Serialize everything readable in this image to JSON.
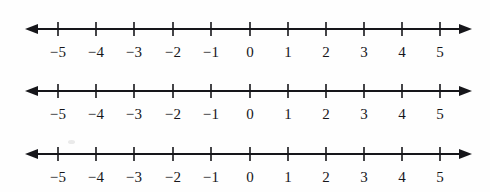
{
  "page": {
    "background_color": "#fefefe",
    "ink_color": "#16161a",
    "width": 490,
    "height": 192
  },
  "chart_data": {
    "type": "line",
    "xlabel": "",
    "ylabel": "",
    "grid": false,
    "legend": null,
    "xlim": [
      -5,
      5
    ],
    "axis_count": 3,
    "tick_values": [
      -5,
      -4,
      -3,
      -2,
      -1,
      0,
      1,
      2,
      3,
      4,
      5
    ],
    "tick_labels": [
      "−5",
      "−4",
      "−3",
      "−2",
      "−1",
      "0",
      "1",
      "2",
      "3",
      "4",
      "5"
    ],
    "tick_interval": 1,
    "arrow_ends": [
      "left",
      "right"
    ],
    "plotted_points": [],
    "axes": [
      {
        "id": "number-line-1",
        "label": "",
        "min": -5,
        "max": 5,
        "tick_labels": [
          "−5",
          "−4",
          "−3",
          "−2",
          "−1",
          "0",
          "1",
          "2",
          "3",
          "4",
          "5"
        ]
      },
      {
        "id": "number-line-2",
        "label": "",
        "min": -5,
        "max": 5,
        "tick_labels": [
          "−5",
          "−4",
          "−3",
          "−2",
          "−1",
          "0",
          "1",
          "2",
          "3",
          "4",
          "5"
        ]
      },
      {
        "id": "number-line-3",
        "label": "",
        "min": -5,
        "max": 5,
        "tick_labels": [
          "−5",
          "−4",
          "−3",
          "−2",
          "−1",
          "0",
          "1",
          "2",
          "3",
          "4",
          "5"
        ]
      }
    ]
  },
  "lines": [
    {
      "name": "number-line-1",
      "top": 0,
      "axis_y": 29,
      "label_y": 45,
      "ticks": [
        {
          "value": -5,
          "x": 58,
          "label": "−5"
        },
        {
          "value": -4,
          "x": 96,
          "label": "−4"
        },
        {
          "value": -3,
          "x": 134,
          "label": "−3"
        },
        {
          "value": -2,
          "x": 173,
          "label": "−2"
        },
        {
          "value": -1,
          "x": 211,
          "label": "−1"
        },
        {
          "value": 0,
          "x": 250,
          "label": "0"
        },
        {
          "value": 1,
          "x": 288,
          "label": "1"
        },
        {
          "value": 2,
          "x": 326,
          "label": "2"
        },
        {
          "value": 3,
          "x": 364,
          "label": "3"
        },
        {
          "value": 4,
          "x": 402,
          "label": "4"
        },
        {
          "value": 5,
          "x": 440,
          "label": "5"
        }
      ]
    },
    {
      "name": "number-line-2",
      "top": 62,
      "axis_y": 29,
      "label_y": 45,
      "ticks": [
        {
          "value": -5,
          "x": 58,
          "label": "−5"
        },
        {
          "value": -4,
          "x": 96,
          "label": "−4"
        },
        {
          "value": -3,
          "x": 134,
          "label": "−3"
        },
        {
          "value": -2,
          "x": 173,
          "label": "−2"
        },
        {
          "value": -1,
          "x": 211,
          "label": "−1"
        },
        {
          "value": 0,
          "x": 250,
          "label": "0"
        },
        {
          "value": 1,
          "x": 288,
          "label": "1"
        },
        {
          "value": 2,
          "x": 326,
          "label": "2"
        },
        {
          "value": 3,
          "x": 364,
          "label": "3"
        },
        {
          "value": 4,
          "x": 402,
          "label": "4"
        },
        {
          "value": 5,
          "x": 440,
          "label": "5"
        }
      ]
    },
    {
      "name": "number-line-3",
      "top": 126,
      "axis_y": 28,
      "label_y": 44,
      "ticks": [
        {
          "value": -5,
          "x": 58,
          "label": "−5"
        },
        {
          "value": -4,
          "x": 96,
          "label": "−4"
        },
        {
          "value": -3,
          "x": 134,
          "label": "−3"
        },
        {
          "value": -2,
          "x": 173,
          "label": "−2"
        },
        {
          "value": -1,
          "x": 211,
          "label": "−1"
        },
        {
          "value": 0,
          "x": 250,
          "label": "0"
        },
        {
          "value": 1,
          "x": 288,
          "label": "1"
        },
        {
          "value": 2,
          "x": 326,
          "label": "2"
        },
        {
          "value": 3,
          "x": 364,
          "label": "3"
        },
        {
          "value": 4,
          "x": 402,
          "label": "4"
        },
        {
          "value": 5,
          "x": 440,
          "label": "5"
        }
      ]
    }
  ],
  "geometry": {
    "arrow_left_tip_x": 25,
    "arrow_right_tip_x": 472,
    "arrow_head_length": 13,
    "arrow_head_half_height": 5,
    "tick_half_height": 7,
    "axis_stroke_width": 1.8,
    "tick_stroke_width": 1.6
  }
}
